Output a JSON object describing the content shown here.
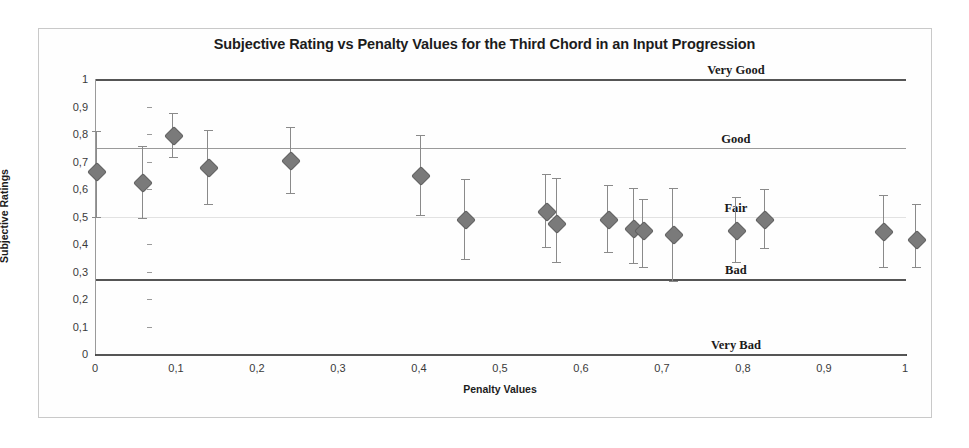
{
  "chart_data": {
    "type": "scatter",
    "title": "Subjective Rating vs Penalty Values for the Third Chord in an Input Progression",
    "xlabel": "Penalty Values",
    "ylabel": "Subjective Ratings",
    "xlim": [
      0,
      1
    ],
    "ylim": [
      0,
      1
    ],
    "grid": false,
    "legend": "none",
    "error_bars": "vertical",
    "xticks": [
      "0",
      "0,1",
      "0,2",
      "0,3",
      "0,4",
      "0,5",
      "0,6",
      "0,7",
      "0,8",
      "0,9",
      "1"
    ],
    "xtick_values": [
      0,
      0.1,
      0.2,
      0.3,
      0.4,
      0.5,
      0.6,
      0.7,
      0.8,
      0.9,
      1
    ],
    "yticks": [
      "0",
      "0,1",
      "0,2",
      "0,3",
      "0,4",
      "0,5",
      "0,6",
      "0,7",
      "0,8",
      "0,9",
      "1"
    ],
    "ytick_values": [
      0,
      0.1,
      0.2,
      0.3,
      0.4,
      0.5,
      0.6,
      0.7,
      0.8,
      0.9,
      1
    ],
    "marker": "diamond",
    "marker_color": "#7a7a7a",
    "errorbar_color": "#8a8a8a",
    "points": [
      {
        "x": 0.0,
        "y": 0.665,
        "yerr_low": 0.5,
        "yerr_high": 0.81
      },
      {
        "x": 0.057,
        "y": 0.625,
        "yerr_low": 0.495,
        "yerr_high": 0.755
      },
      {
        "x": 0.095,
        "y": 0.795,
        "yerr_low": 0.715,
        "yerr_high": 0.875
      },
      {
        "x": 0.138,
        "y": 0.68,
        "yerr_low": 0.545,
        "yerr_high": 0.815
      },
      {
        "x": 0.24,
        "y": 0.705,
        "yerr_low": 0.585,
        "yerr_high": 0.825
      },
      {
        "x": 0.4,
        "y": 0.65,
        "yerr_low": 0.505,
        "yerr_high": 0.795
      },
      {
        "x": 0.455,
        "y": 0.49,
        "yerr_low": 0.345,
        "yerr_high": 0.635
      },
      {
        "x": 0.555,
        "y": 0.52,
        "yerr_low": 0.39,
        "yerr_high": 0.655
      },
      {
        "x": 0.568,
        "y": 0.478,
        "yerr_low": 0.335,
        "yerr_high": 0.64
      },
      {
        "x": 0.632,
        "y": 0.49,
        "yerr_low": 0.37,
        "yerr_high": 0.615
      },
      {
        "x": 0.663,
        "y": 0.46,
        "yerr_low": 0.33,
        "yerr_high": 0.605
      },
      {
        "x": 0.675,
        "y": 0.45,
        "yerr_low": 0.315,
        "yerr_high": 0.565
      },
      {
        "x": 0.712,
        "y": 0.435,
        "yerr_low": 0.265,
        "yerr_high": 0.605
      },
      {
        "x": 0.79,
        "y": 0.452,
        "yerr_low": 0.335,
        "yerr_high": 0.57
      },
      {
        "x": 0.825,
        "y": 0.492,
        "yerr_low": 0.385,
        "yerr_high": 0.6
      },
      {
        "x": 0.972,
        "y": 0.448,
        "yerr_low": 0.315,
        "yerr_high": 0.58
      },
      {
        "x": 1.012,
        "y": 0.418,
        "yerr_low": 0.315,
        "yerr_high": 0.545
      }
    ],
    "reference_lines": [
      {
        "label": "Very Good",
        "y": 1.0,
        "weight": "heavy"
      },
      {
        "label": "Good",
        "y": 0.748,
        "weight": "medium"
      },
      {
        "label": "Fair",
        "y": 0.498,
        "weight": "light"
      },
      {
        "label": "Bad",
        "y": 0.272,
        "weight": "heavy"
      },
      {
        "label": "Very Bad",
        "y": 0.0,
        "weight": "heavy"
      }
    ]
  }
}
